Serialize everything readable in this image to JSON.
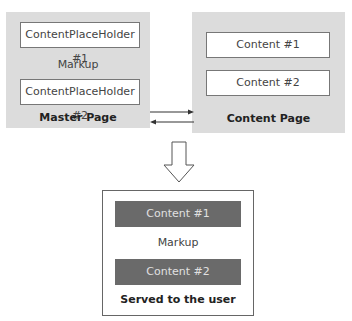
{
  "master_page": {
    "title": "Master Page",
    "placeholder_1": "ContentPlaceHolder #1",
    "markup": "Markup",
    "placeholder_2": "ContentPlaceHolder #2"
  },
  "content_page": {
    "title": "Content Page",
    "content_1": "Content  #1",
    "content_2": "Content  #2"
  },
  "served": {
    "title": "Served to the user",
    "content_1": "Content  #1",
    "markup": "Markup",
    "content_2": "Content  #2"
  },
  "colors": {
    "panel": "#dcdcdc",
    "dark_block": "#6a6a6a",
    "border": "#777777"
  }
}
